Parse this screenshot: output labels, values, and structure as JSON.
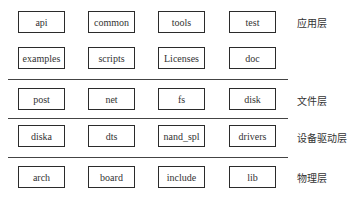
{
  "diagram": {
    "type": "layered-architecture",
    "columns_x": [
      18,
      88,
      158,
      229
    ],
    "layers": [
      {
        "label": "应用层",
        "label_y": 22,
        "rows": [
          {
            "y": 11,
            "modules": [
              "api",
              "common",
              "tools",
              "test"
            ]
          },
          {
            "y": 47,
            "modules": [
              "examples",
              "scripts",
              "Licenses",
              "doc"
            ]
          }
        ]
      },
      {
        "label": "文件层",
        "label_y": 100,
        "rows": [
          {
            "y": 88,
            "modules": [
              "post",
              "net",
              "fs",
              "disk"
            ]
          }
        ]
      },
      {
        "label": "设备驱动层",
        "label_y": 137,
        "rows": [
          {
            "y": 125,
            "modules": [
              "diska",
              "dts",
              "nand_spl",
              "drivers"
            ]
          }
        ]
      },
      {
        "label": "物理层",
        "label_y": 177,
        "rows": [
          {
            "y": 166,
            "modules": [
              "arch",
              "board",
              "include",
              "lib"
            ]
          }
        ]
      }
    ],
    "dividers_y": [
      79,
      118,
      157
    ]
  }
}
